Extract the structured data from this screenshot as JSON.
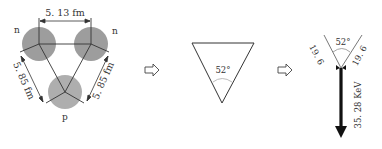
{
  "panel1": {
    "top_label": "5. 13 fm",
    "left_label": "5. 85 fm",
    "right_label": "5. 85 fm",
    "node_left": "n",
    "node_right": "n",
    "node_bottom": "p",
    "circle_color": "#8a8a8a"
  },
  "panel2": {
    "angle_label": "52°"
  },
  "panel3": {
    "angle_label": "52°",
    "left_arm_label": "19. 6",
    "right_arm_label": "19. 6",
    "arrow_label": "35. 28  KeV"
  },
  "arrows": {
    "icon": "hollow-right-arrow"
  }
}
